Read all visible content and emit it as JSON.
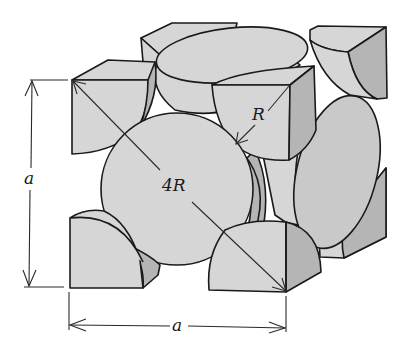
{
  "figure": {
    "type": "fcc-unit-cell-hard-sphere",
    "labels": {
      "edge_vertical": "a",
      "edge_horizontal": "a",
      "face_diagonal": "4R",
      "radius": "R"
    },
    "colors": {
      "sphere_fill": "#d6d6d6",
      "sphere_side": "#b5b5b5",
      "outline": "#1a1a1a",
      "background": "#ffffff"
    }
  }
}
